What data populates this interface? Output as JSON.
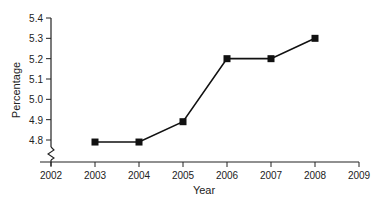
{
  "chart_data": {
    "type": "line",
    "title": "",
    "xlabel": "Year",
    "ylabel": "Percentage",
    "x": [
      2003,
      2004,
      2005,
      2006,
      2007,
      2008
    ],
    "values": [
      4.79,
      4.79,
      4.89,
      5.2,
      5.2,
      5.3
    ],
    "xticks": [
      "2002",
      "2003",
      "2004",
      "2005",
      "2006",
      "2007",
      "2008",
      "2009"
    ],
    "yticks": [
      "4.8",
      "4.9",
      "5.0",
      "5.1",
      "5.2",
      "5.3",
      "5.4"
    ],
    "xlim": [
      2002,
      2009
    ],
    "ylim": [
      4.8,
      5.4
    ],
    "axis_break": true,
    "grid": false,
    "marker": "square",
    "line_color": "#111111"
  }
}
